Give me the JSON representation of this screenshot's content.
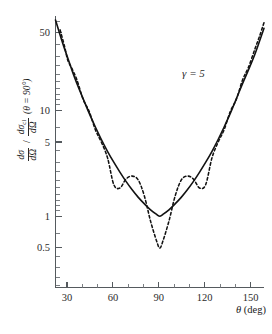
{
  "figure": {
    "background_color": "#ffffff",
    "ink_color": "#121212",
    "axis_color": "#555a5e"
  },
  "axes": {
    "x": {
      "label_symbol": "θ",
      "label_unit": "(deg)",
      "tick_labels": [
        "30",
        "60",
        "90",
        "120",
        "150"
      ],
      "tick_values": [
        30,
        60,
        90,
        120,
        150
      ],
      "range": [
        22,
        158
      ],
      "minor_tick_values": [
        40,
        50,
        70,
        80,
        100,
        110,
        130,
        140
      ],
      "scale": "linear"
    },
    "y": {
      "label_parts": {
        "numerator_1": "dσ",
        "denominator_1": "dΩ",
        "separator": "/",
        "numerator_2": "dσ",
        "numerator_2_sub": "cl",
        "denominator_2": "dΩ",
        "condition": "(θ = 90°)"
      },
      "tick_labels": [
        "50",
        "10",
        "5",
        "1",
        "0.5"
      ],
      "tick_values": [
        50,
        10,
        5,
        1,
        0.5
      ],
      "range": [
        0.33,
        75
      ],
      "scale": "log"
    }
  },
  "annotations": [
    {
      "name": "gamma-annotation",
      "text": "γ = 5",
      "x_deg": 112,
      "y_value": 21
    }
  ],
  "chart_data": {
    "type": "line",
    "title": "",
    "xlabel": "θ (deg)",
    "ylabel": "dσ/dΩ / dσ_cl/dΩ (θ = 90°)",
    "xlim": [
      22,
      158
    ],
    "ylim": [
      0.33,
      75
    ],
    "yscale": "log",
    "xscale": "linear",
    "grid": false,
    "legend": null,
    "x": [
      22,
      25,
      28,
      30,
      33,
      36,
      40,
      44,
      48,
      52,
      56,
      60,
      64,
      68,
      72,
      76,
      80,
      84,
      88,
      90,
      92,
      96,
      100,
      104,
      108,
      112,
      116,
      120,
      124,
      128,
      132,
      136,
      140,
      144,
      148,
      152,
      155,
      158
    ],
    "series": [
      {
        "name": "classical (Rutherford-like) ratio",
        "style": "solid",
        "values": [
          72.0,
          52.0,
          38.0,
          31.5,
          23.5,
          18.0,
          13.0,
          9.4,
          7.0,
          5.3,
          4.1,
          3.25,
          2.62,
          2.14,
          1.78,
          1.51,
          1.31,
          1.15,
          1.04,
          1.0,
          1.04,
          1.15,
          1.31,
          1.51,
          1.78,
          2.14,
          2.62,
          3.25,
          4.1,
          5.3,
          7.0,
          9.4,
          13.0,
          18.0,
          24.5,
          34.0,
          45.0,
          60.0
        ]
      },
      {
        "name": "Mott (identical-particle interference) ratio, γ = 5",
        "style": "dashed",
        "values": [
          80.0,
          58.0,
          40.0,
          30.0,
          24.5,
          19.5,
          12.8,
          9.8,
          6.6,
          5.0,
          3.55,
          2.0,
          1.85,
          2.25,
          2.4,
          2.2,
          1.55,
          0.9,
          0.58,
          0.5,
          0.58,
          0.9,
          1.55,
          2.2,
          2.4,
          2.25,
          1.85,
          2.0,
          3.55,
          5.0,
          6.6,
          9.8,
          12.8,
          19.5,
          26.0,
          38.0,
          50.0,
          68.0
        ]
      }
    ],
    "notes": {
      "solid_min_value": 1.0,
      "solid_min_at_deg": 90,
      "dashed_min_value": 0.5,
      "dashed_min_at_deg": 90,
      "dashed_secondary_max_value": 2.4,
      "dashed_secondary_max_at_deg": [
        72,
        108
      ]
    }
  }
}
